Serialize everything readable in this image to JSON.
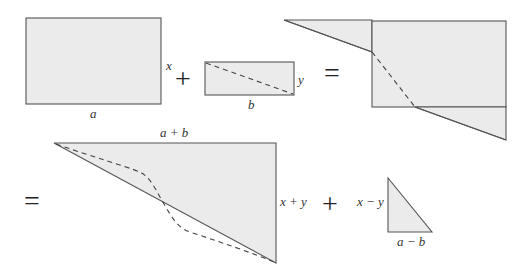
{
  "diagram": {
    "colors": {
      "fill": "#ebebeb",
      "stroke": "#555555",
      "text": "#333333"
    },
    "row1": {
      "rect_a": {
        "width_label": "a",
        "height_label": "x"
      },
      "operator_plus": "+",
      "rect_b": {
        "width_label": "b",
        "height_label": "y",
        "has_dashed_diagonal": true
      },
      "operator_equals": "=",
      "composite": {
        "description": "rectangle a×x with triangles attached top-left and bottom-right, dashed diagonal"
      }
    },
    "row2": {
      "operator_equals": "=",
      "big_triangle": {
        "top_label": "a + b",
        "side_label": "x + y",
        "has_dashed_curve": true
      },
      "operator_plus": "+",
      "small_triangle": {
        "side_label": "x − y",
        "bottom_label": "a − b"
      }
    }
  }
}
